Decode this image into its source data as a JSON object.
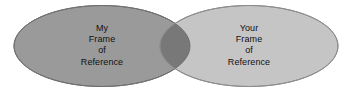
{
  "diagram": {
    "type": "venn-2-set",
    "background_color": "#ffffff",
    "width": 354,
    "height": 94,
    "sets": [
      {
        "id": "left",
        "name": "my-frame-of-reference",
        "lines": [
          "My",
          "Frame",
          "of",
          "Reference"
        ],
        "fill_color": "#9a9a9a",
        "stroke_color": "#6f6f6f",
        "center_x": 102,
        "center_y": 46,
        "radius_x": 88,
        "radius_y": 40.5
      },
      {
        "id": "right",
        "name": "your-frame-of-reference",
        "lines": [
          "Your",
          "Frame",
          "of",
          "Reference"
        ],
        "fill_color": "#c5c5c5",
        "stroke_color": "#8c8c8c",
        "center_x": 249,
        "center_y": 46,
        "radius_x": 89,
        "radius_y": 40.5
      }
    ],
    "intersection": {
      "name": "shared-frame-overlap",
      "fill_color": "#787878",
      "label": ""
    },
    "text_color": "#111111"
  }
}
